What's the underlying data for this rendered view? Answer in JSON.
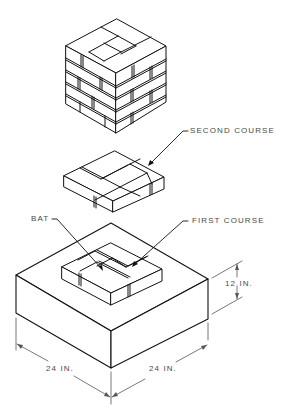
{
  "figure": {
    "labels": {
      "second_course": "SECOND COURSE",
      "first_course": "FIRST COURSE",
      "bat": "BAT"
    },
    "dimensions": {
      "height": "12 IN.",
      "width_left": "24 IN.",
      "width_right": "24 IN."
    },
    "colors": {
      "line": "#111111",
      "dimension_line": "#555555",
      "text": "#4a4a4a",
      "background": "#ffffff"
    }
  }
}
